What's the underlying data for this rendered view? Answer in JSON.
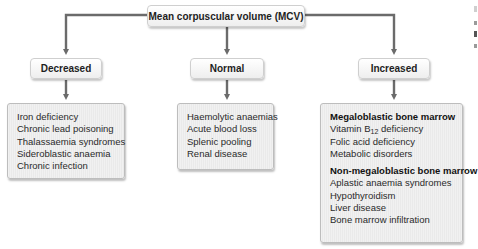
{
  "diagram": {
    "root": {
      "label": "Mean corpuscular volume (MCV)"
    },
    "branches": [
      {
        "label": "Decreased",
        "items": [
          "Iron deficiency",
          "Chronic lead poisoning",
          "Thalassaemia syndromes",
          "Sideroblastic anaemia",
          "Chronic infection"
        ]
      },
      {
        "label": "Normal",
        "items": [
          "Haemolytic anaemias",
          "Acute blood loss",
          "Splenic pooling",
          "Renal disease"
        ]
      },
      {
        "label": "Increased",
        "groups": [
          {
            "heading": "Megaloblastic bone marrow",
            "items": [
              {
                "prefix": "Vitamin B",
                "subscript": "12",
                "suffix": " deficiency"
              },
              "Folic acid deficiency",
              "Metabolic disorders"
            ]
          },
          {
            "heading": "Non-megaloblastic bone marrow",
            "items": [
              "Aplastic anaemia syndromes",
              "Hypothyroidism",
              "Liver disease",
              "Bone marrow infiltration"
            ]
          }
        ]
      }
    ],
    "colors": {
      "connector": "#6b6b6b",
      "node_border": "#cfcfcf",
      "list_border": "#bdbdbd"
    }
  }
}
